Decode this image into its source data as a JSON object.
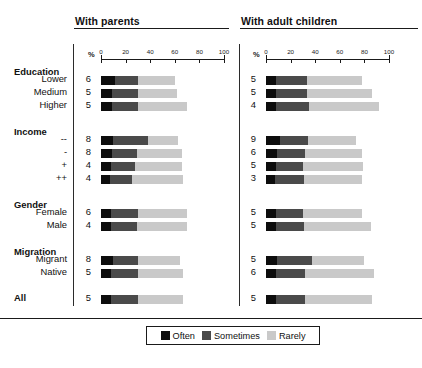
{
  "panels": {
    "left": {
      "title": "With parents"
    },
    "right": {
      "title": "With adult children"
    }
  },
  "axis": {
    "unit": "%",
    "ticks": [
      "0",
      "20",
      "40",
      "60",
      "80",
      "100"
    ],
    "min": 0,
    "max": 100
  },
  "legend": {
    "items": [
      {
        "label": "Often",
        "color": "#0d0d0d"
      },
      {
        "label": "Sometimes",
        "color": "#4a4a4a"
      },
      {
        "label": "Rarely",
        "color": "#c9c9c9"
      }
    ]
  },
  "groups": [
    {
      "name": "Education"
    },
    {
      "name": "Income"
    },
    {
      "name": "Gender"
    },
    {
      "name": "Migration"
    },
    {
      "name": "All"
    }
  ],
  "rows": [
    {
      "label": "Lower",
      "group": "Education"
    },
    {
      "label": "Medium",
      "group": "Education"
    },
    {
      "label": "Higher",
      "group": "Education"
    },
    {
      "label": "--",
      "group": "Income"
    },
    {
      "label": "-",
      "group": "Income"
    },
    {
      "label": "+",
      "group": "Income"
    },
    {
      "label": "++",
      "group": "Income"
    },
    {
      "label": "Female",
      "group": "Gender"
    },
    {
      "label": "Male",
      "group": "Gender"
    },
    {
      "label": "Migrant",
      "group": "Migration"
    },
    {
      "label": "Native",
      "group": "Migration"
    },
    {
      "label": "",
      "group": "All"
    }
  ],
  "chart_data": {
    "type": "bar",
    "title": "",
    "xlabel": "%",
    "ylabel": "",
    "xlim": [
      0,
      100
    ],
    "grid": false,
    "legend_position": "bottom",
    "orientation": "horizontal",
    "stacked": true,
    "series_names": [
      "Often",
      "Sometimes",
      "Rarely"
    ],
    "categories": [
      "Lower",
      "Medium",
      "Higher",
      "--",
      "-",
      "+",
      "++",
      "Female",
      "Male",
      "Migrant",
      "Native",
      "All"
    ],
    "panels": [
      {
        "name": "With parents",
        "value_labels": [
          6,
          5,
          5,
          8,
          8,
          4,
          4,
          6,
          4,
          8,
          5,
          5
        ],
        "rows": [
          {
            "category": "Lower",
            "value_label": 6,
            "often": 11,
            "sometimes": 19,
            "rarely": 30
          },
          {
            "category": "Medium",
            "value_label": 5,
            "often": 9,
            "sometimes": 21,
            "rarely": 32
          },
          {
            "category": "Higher",
            "value_label": 5,
            "often": 9,
            "sometimes": 21,
            "rarely": 40
          },
          {
            "category": "--",
            "value_label": 8,
            "often": 10,
            "sometimes": 28,
            "rarely": 25
          },
          {
            "category": "-",
            "value_label": 8,
            "often": 9,
            "sometimes": 20,
            "rarely": 37
          },
          {
            "category": "+",
            "value_label": 4,
            "often": 8,
            "sometimes": 20,
            "rarely": 38
          },
          {
            "category": "++",
            "value_label": 4,
            "often": 7,
            "sometimes": 18,
            "rarely": 42
          },
          {
            "category": "Female",
            "value_label": 6,
            "often": 8,
            "sometimes": 22,
            "rarely": 40
          },
          {
            "category": "Male",
            "value_label": 4,
            "often": 8,
            "sometimes": 21,
            "rarely": 41
          },
          {
            "category": "Migrant",
            "value_label": 8,
            "often": 10,
            "sometimes": 20,
            "rarely": 34
          },
          {
            "category": "Native",
            "value_label": 5,
            "often": 8,
            "sometimes": 22,
            "rarely": 37
          },
          {
            "category": "All",
            "value_label": 5,
            "often": 8,
            "sometimes": 22,
            "rarely": 37
          }
        ]
      },
      {
        "name": "With adult children",
        "value_labels": [
          5,
          5,
          4,
          9,
          6,
          5,
          3,
          5,
          5,
          5,
          6,
          5
        ],
        "rows": [
          {
            "category": "Lower",
            "value_label": 5,
            "often": 8,
            "sometimes": 25,
            "rarely": 45
          },
          {
            "category": "Medium",
            "value_label": 5,
            "often": 8,
            "sometimes": 25,
            "rarely": 53
          },
          {
            "category": "Higher",
            "value_label": 4,
            "often": 8,
            "sometimes": 27,
            "rarely": 57
          },
          {
            "category": "--",
            "value_label": 9,
            "often": 11,
            "sometimes": 23,
            "rarely": 39
          },
          {
            "category": "-",
            "value_label": 6,
            "often": 9,
            "sometimes": 23,
            "rarely": 46
          },
          {
            "category": "+",
            "value_label": 5,
            "often": 8,
            "sometimes": 22,
            "rarely": 49
          },
          {
            "category": "++",
            "value_label": 3,
            "often": 7,
            "sometimes": 24,
            "rarely": 47
          },
          {
            "category": "Female",
            "value_label": 5,
            "often": 8,
            "sometimes": 22,
            "rarely": 48
          },
          {
            "category": "Male",
            "value_label": 5,
            "often": 8,
            "sometimes": 23,
            "rarely": 54
          },
          {
            "category": "Migrant",
            "value_label": 5,
            "often": 9,
            "sometimes": 28,
            "rarely": 43
          },
          {
            "category": "Native",
            "value_label": 6,
            "often": 8,
            "sometimes": 24,
            "rarely": 56
          },
          {
            "category": "All",
            "value_label": 5,
            "often": 8,
            "sometimes": 24,
            "rarely": 54
          }
        ]
      }
    ]
  }
}
